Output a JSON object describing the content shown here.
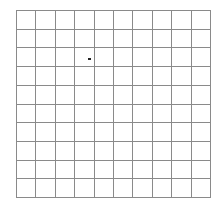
{
  "board": {
    "rows": 10,
    "cols": 10,
    "line_color": "#8a8a8a",
    "background": "#ffffff",
    "markers": [
      {
        "row": 2,
        "col": 3,
        "color": "#222222",
        "offset_x": 13,
        "offset_y": 10
      }
    ]
  }
}
